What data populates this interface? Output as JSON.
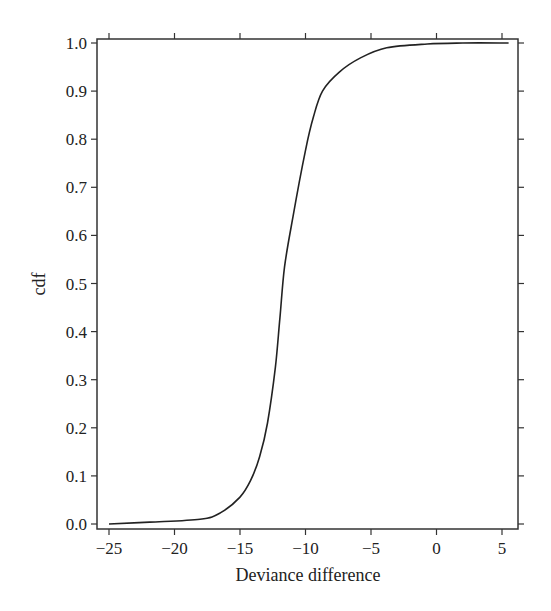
{
  "chart_data": {
    "type": "line",
    "title": "",
    "xlabel": "Deviance difference",
    "ylabel": "cdf",
    "xlim": [
      -26.5,
      6.5
    ],
    "ylim": [
      -0.01,
      1.01
    ],
    "x_ticks": [
      -25,
      -20,
      -15,
      -10,
      -5,
      0,
      5
    ],
    "x_tick_labels": [
      "−25",
      "−20",
      "−15",
      "−10",
      "−5",
      "0",
      "5"
    ],
    "y_ticks": [
      0.0,
      0.1,
      0.2,
      0.3,
      0.4,
      0.5,
      0.6,
      0.7,
      0.8,
      0.9,
      1.0
    ],
    "y_tick_labels": [
      "0.0",
      "0.1",
      "0.2",
      "0.3",
      "0.4",
      "0.5",
      "0.6",
      "0.7",
      "0.8",
      "0.9",
      "1.0"
    ],
    "grid": false,
    "legend": null,
    "series": [
      {
        "name": "cdf",
        "color": "#222222",
        "x": [
          -25.0,
          -21.9,
          -18.05,
          -16.5,
          -15.0,
          -14.2,
          -13.5,
          -12.9,
          -12.3,
          -11.95,
          -11.6,
          -10.95,
          -10.0,
          -9.4,
          -8.7,
          -7.4,
          -5.8,
          -3.8,
          -0.7,
          2.0,
          5.5
        ],
        "y": [
          0.0,
          0.004,
          0.01,
          0.023,
          0.056,
          0.09,
          0.14,
          0.21,
          0.326,
          0.43,
          0.534,
          0.64,
          0.777,
          0.846,
          0.9,
          0.94,
          0.969,
          0.99,
          0.998,
          1.0,
          1.0
        ]
      }
    ]
  }
}
